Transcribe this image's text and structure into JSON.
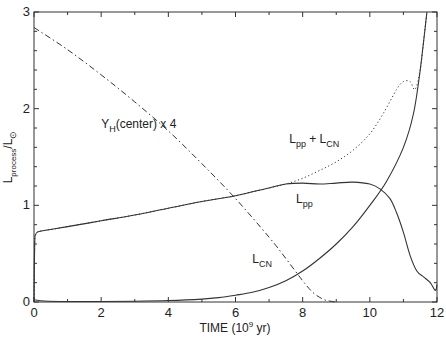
{
  "chart_data": {
    "type": "line",
    "title": "",
    "xlabel": "TIME (10⁹ yr)",
    "ylabel": "L_process / L_⊙",
    "xlim": [
      0,
      12
    ],
    "ylim": [
      0,
      3
    ],
    "xticks": [
      0,
      2,
      4,
      6,
      8,
      10,
      12
    ],
    "yticks": [
      0,
      1,
      2,
      3
    ],
    "xtick_labels": [
      "0",
      "2",
      "4",
      "6",
      "8",
      "10",
      "12"
    ],
    "ytick_labels": [
      "0",
      "1",
      "2",
      "3"
    ],
    "grid": false,
    "legend": "none",
    "series": [
      {
        "name": "L_pp + L_CN",
        "style": "dotted",
        "x": [
          0,
          0.02,
          0.05,
          0.15,
          0.5,
          1,
          2,
          3,
          4,
          5,
          6,
          7,
          7.5,
          8,
          8.5,
          9,
          9.5,
          10,
          10.4,
          10.8,
          11.0,
          11.2,
          11.35,
          11.5,
          11.6,
          11.7
        ],
        "y": [
          0,
          0.6,
          0.7,
          0.73,
          0.75,
          0.78,
          0.84,
          0.9,
          0.97,
          1.04,
          1.1,
          1.18,
          1.22,
          1.28,
          1.36,
          1.45,
          1.57,
          1.74,
          1.95,
          2.2,
          2.28,
          2.28,
          2.2,
          2.4,
          2.7,
          3.0
        ]
      },
      {
        "name": "L_pp",
        "style": "solid",
        "x": [
          0,
          0.02,
          0.05,
          0.15,
          0.5,
          1,
          2,
          3,
          4,
          5,
          6,
          7,
          7.5,
          8,
          8.5,
          9,
          9.5,
          10,
          10.3,
          10.6,
          10.8,
          11.0,
          11.2,
          11.4,
          11.6,
          11.8,
          11.95,
          12.0
        ],
        "y": [
          0,
          0.6,
          0.7,
          0.73,
          0.75,
          0.78,
          0.84,
          0.9,
          0.97,
          1.04,
          1.1,
          1.18,
          1.22,
          1.23,
          1.22,
          1.23,
          1.24,
          1.22,
          1.17,
          1.07,
          0.92,
          0.72,
          0.48,
          0.32,
          0.26,
          0.2,
          0.12,
          0.18
        ]
      },
      {
        "name": "L_CN",
        "style": "solid",
        "x": [
          0,
          0.05,
          0.3,
          1,
          2,
          3,
          4,
          5,
          5.5,
          6,
          6.5,
          7,
          7.5,
          8,
          8.5,
          9,
          9.5,
          10,
          10.5,
          11,
          11.3,
          11.5,
          11.7
        ],
        "y": [
          0.02,
          0.02,
          0.01,
          0.005,
          0.005,
          0.008,
          0.015,
          0.03,
          0.045,
          0.07,
          0.1,
          0.15,
          0.22,
          0.32,
          0.45,
          0.6,
          0.78,
          1.0,
          1.25,
          1.6,
          1.95,
          2.4,
          3.0
        ]
      },
      {
        "name": "Y_H(center) x 4",
        "style": "dashdot",
        "x": [
          0,
          1,
          2,
          3,
          4,
          5,
          6,
          7,
          7.5,
          8,
          8.3,
          8.6,
          8.8,
          9.0
        ],
        "y": [
          2.84,
          2.61,
          2.35,
          2.07,
          1.77,
          1.43,
          1.07,
          0.67,
          0.45,
          0.22,
          0.1,
          0.03,
          0.01,
          0.0
        ]
      }
    ],
    "annotations": [
      {
        "main": "Y",
        "sub": "H",
        "rest": "(center) x 4",
        "x": 2.0,
        "y": 1.8
      },
      {
        "main": "L",
        "sub": "pp",
        "rest": " + L",
        "sub2": "CN",
        "x": 7.6,
        "y": 1.65
      },
      {
        "main": "L",
        "sub": "pp",
        "rest": "",
        "x": 7.8,
        "y": 1.02
      },
      {
        "main": "L",
        "sub": "CN",
        "rest": "",
        "x": 6.5,
        "y": 0.4
      }
    ],
    "ylabel_parts": {
      "main": "L",
      "sub": "process",
      "slash": "/L",
      "sub2": "⊙"
    },
    "xlabel_parts": {
      "main": "TIME (10",
      "sup": "9",
      "rest": " yr)"
    }
  }
}
